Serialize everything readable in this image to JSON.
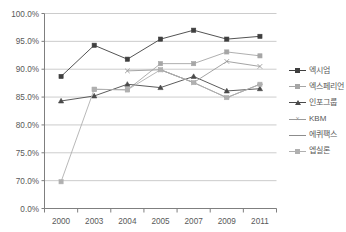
{
  "chart_data": {
    "type": "line",
    "title": "",
    "xlabel": "",
    "ylabel": "",
    "categories": [
      "2000",
      "2003",
      "2004",
      "2005",
      "2007",
      "2009",
      "2011"
    ],
    "y_tick_labels": [
      "100.0%",
      "95.0%",
      "90.0%",
      "85.0%",
      "80.0%",
      "75.0%",
      "70.0%",
      "0.0%"
    ],
    "y_tick_values": [
      100.0,
      95.0,
      90.0,
      85.0,
      80.0,
      75.0,
      70.0,
      0.0
    ],
    "axis_note": "broken axis: ticks evenly spaced from 100.0% down to 70.0%, then 0.0%",
    "grid": "horizontal",
    "legend_position": "right",
    "series": [
      {
        "name": "엑시엄",
        "marker": "square",
        "color": "#3f3f3f",
        "values": [
          88.7,
          94.3,
          91.8,
          95.4,
          97.0,
          95.4,
          95.9
        ]
      },
      {
        "name": "엑스페리언",
        "marker": "square",
        "color": "#a6a6a6",
        "values": [
          null,
          86.4,
          86.3,
          91.0,
          91.0,
          93.1,
          92.4
        ]
      },
      {
        "name": "인포그룹",
        "marker": "triangle",
        "color": "#4a4a4a",
        "values": [
          84.3,
          85.2,
          87.3,
          86.7,
          88.7,
          86.1,
          86.5
        ]
      },
      {
        "name": "KBM",
        "marker": "x",
        "color": "#9a9a9a",
        "values": [
          null,
          null,
          89.7,
          89.9,
          87.6,
          91.4,
          90.5
        ]
      },
      {
        "name": "에퀴팩스",
        "marker": "dash",
        "color": "#8c8c8c",
        "values": [
          null,
          null,
          null,
          89.9,
          87.6,
          84.9,
          87.3
        ]
      },
      {
        "name": "엡실론",
        "marker": "square",
        "color": "#b0b0b0",
        "values": [
          67.2,
          86.4,
          86.3,
          89.9,
          87.6,
          84.9,
          87.3
        ]
      }
    ]
  },
  "axis_colors": {
    "grid": "#bfbfbf",
    "axis": "#7f7f7f",
    "tick_text": "#595959"
  }
}
